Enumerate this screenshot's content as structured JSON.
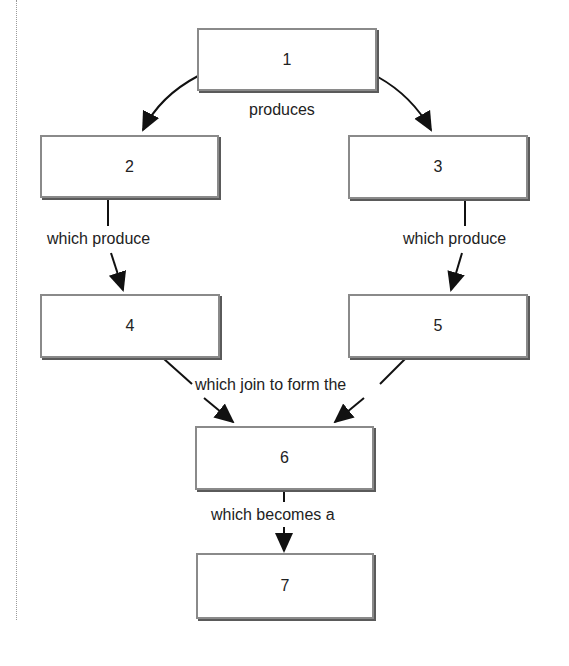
{
  "diagram": {
    "type": "flowchart",
    "nodes": [
      {
        "id": "1",
        "label": "1"
      },
      {
        "id": "2",
        "label": "2"
      },
      {
        "id": "3",
        "label": "3"
      },
      {
        "id": "4",
        "label": "4"
      },
      {
        "id": "5",
        "label": "5"
      },
      {
        "id": "6",
        "label": "6"
      },
      {
        "id": "7",
        "label": "7"
      }
    ],
    "edges": [
      {
        "from": "1",
        "to": "2",
        "label": "produces"
      },
      {
        "from": "1",
        "to": "3",
        "label": "produces"
      },
      {
        "from": "2",
        "to": "4",
        "label": "which produce"
      },
      {
        "from": "3",
        "to": "5",
        "label": "which produce"
      },
      {
        "from": "4",
        "to": "6",
        "label": "which join to form the"
      },
      {
        "from": "5",
        "to": "6",
        "label": "which join to form the"
      },
      {
        "from": "6",
        "to": "7",
        "label": "which becomes a"
      }
    ],
    "labels": {
      "produces": "produces",
      "which_produce_left": "which produce",
      "which_produce_right": "which produce",
      "which_join": "which join to form the",
      "which_becomes": "which becomes a"
    }
  }
}
